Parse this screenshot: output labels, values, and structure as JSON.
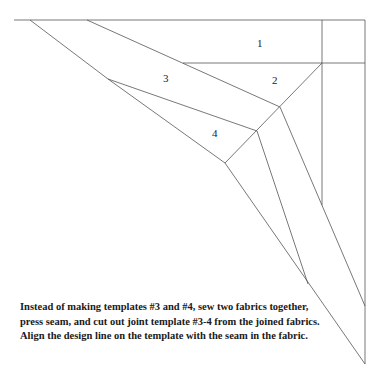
{
  "labels": {
    "p1": "1",
    "p2": "2",
    "p3": "3",
    "p4": "4"
  },
  "caption": "Instead of making templates #3 and #4, sew two fabrics together, press seam, and cut out joint template #3-4 from the joined fabrics. Align the design line on the template with the seam in the fabric.",
  "colors": {
    "line": "#555555",
    "text": "#1a1a1a"
  }
}
